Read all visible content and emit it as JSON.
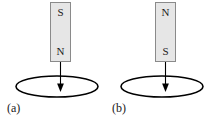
{
  "figure": {
    "background_color": "#ffffff",
    "width": 210,
    "height": 123,
    "stroke_color": "#000000",
    "magnet_fill_color": "#e6e6e6",
    "magnet_border_color": "#8a8a8a"
  },
  "panels": [
    {
      "id": "a",
      "caption": "(a)",
      "magnet": {
        "top_pole": "S",
        "bottom_pole": "N"
      },
      "arrow": {
        "direction": "down"
      },
      "loop": {
        "shape": "ellipse"
      }
    },
    {
      "id": "b",
      "caption": "(b)",
      "magnet": {
        "top_pole": "N",
        "bottom_pole": "S"
      },
      "arrow": {
        "direction": "down"
      },
      "loop": {
        "shape": "ellipse"
      }
    }
  ]
}
